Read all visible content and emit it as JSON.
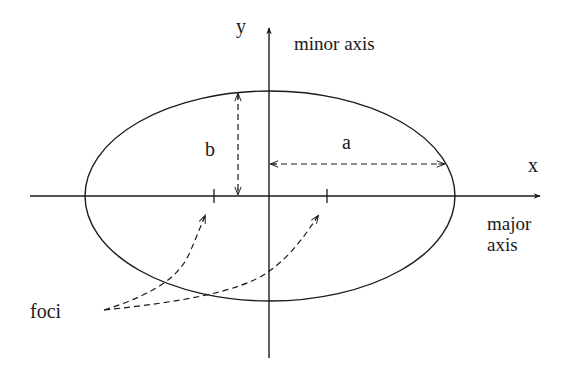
{
  "diagram": {
    "colors": {
      "ink": "#1a1a1a",
      "background": "#ffffff"
    },
    "labels": {
      "y_axis": "y",
      "x_axis": "x",
      "minor_axis": "minor axis",
      "major_axis_line1": "major",
      "major_axis_line2": "axis",
      "semi_minor": "b",
      "semi_major": "a",
      "foci": "foci"
    },
    "geometry": {
      "center": [
        270,
        196
      ],
      "rx": 185,
      "ry": 105,
      "foci_x": [
        214,
        327
      ]
    }
  }
}
